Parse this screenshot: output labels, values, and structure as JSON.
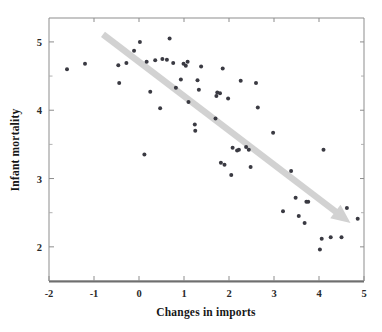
{
  "chart_data": {
    "type": "scatter",
    "title": "",
    "xlabel": "Changes in imports",
    "ylabel": "Infant mortality",
    "xlim": [
      -2,
      5
    ],
    "ylim": [
      1.5,
      5.35
    ],
    "xticks": [
      -2,
      -1,
      0,
      1,
      2,
      3,
      4,
      5
    ],
    "xtick_labels": [
      "-2",
      "-1",
      "0",
      "1",
      "2",
      "3",
      "4",
      "5"
    ],
    "yticks": [
      2,
      3,
      4,
      5
    ],
    "ytick_labels": [
      "2",
      "3",
      "4",
      "5"
    ],
    "yticks_minor": [
      2.5,
      3.5,
      4.5
    ],
    "grid": false,
    "legend": null,
    "marker_color": "#3a3a42",
    "trend_color": "#d2d2d2",
    "annotations": [
      {
        "type": "arrow",
        "label": "downward-trend-arrow",
        "from": [
          -0.8,
          5.11
        ],
        "to": [
          4.7,
          2.35
        ],
        "color": "#d2d2d2"
      }
    ],
    "points": [
      [
        -1.6,
        4.6
      ],
      [
        -1.2,
        4.68
      ],
      [
        -0.46,
        4.66
      ],
      [
        -0.44,
        4.4
      ],
      [
        -0.28,
        4.69
      ],
      [
        -0.11,
        4.87
      ],
      [
        0.02,
        5.0
      ],
      [
        0.12,
        3.35
      ],
      [
        0.17,
        4.71
      ],
      [
        0.25,
        4.27
      ],
      [
        0.36,
        4.73
      ],
      [
        0.47,
        4.03
      ],
      [
        0.52,
        4.75
      ],
      [
        0.62,
        4.74
      ],
      [
        0.68,
        5.05
      ],
      [
        0.76,
        4.69
      ],
      [
        0.82,
        4.33
      ],
      [
        0.93,
        4.45
      ],
      [
        0.99,
        4.68
      ],
      [
        1.04,
        4.65
      ],
      [
        1.08,
        4.71
      ],
      [
        1.1,
        4.12
      ],
      [
        1.24,
        3.79
      ],
      [
        1.25,
        3.7
      ],
      [
        1.3,
        4.44
      ],
      [
        1.33,
        4.3
      ],
      [
        1.38,
        4.64
      ],
      [
        1.7,
        3.88
      ],
      [
        1.72,
        4.21
      ],
      [
        1.74,
        4.26
      ],
      [
        1.8,
        4.25
      ],
      [
        1.82,
        3.23
      ],
      [
        1.86,
        4.61
      ],
      [
        1.9,
        3.2
      ],
      [
        1.98,
        4.17
      ],
      [
        2.05,
        3.05
      ],
      [
        2.08,
        3.45
      ],
      [
        2.18,
        3.41
      ],
      [
        2.22,
        3.42
      ],
      [
        2.26,
        4.43
      ],
      [
        2.38,
        3.46
      ],
      [
        2.44,
        3.42
      ],
      [
        2.48,
        3.17
      ],
      [
        2.6,
        4.4
      ],
      [
        2.64,
        4.04
      ],
      [
        2.98,
        3.67
      ],
      [
        3.2,
        2.52
      ],
      [
        3.38,
        3.11
      ],
      [
        3.48,
        2.72
      ],
      [
        3.55,
        2.45
      ],
      [
        3.68,
        2.35
      ],
      [
        3.72,
        2.66
      ],
      [
        3.76,
        2.66
      ],
      [
        4.02,
        1.96
      ],
      [
        4.06,
        2.12
      ],
      [
        4.1,
        3.42
      ],
      [
        4.26,
        2.14
      ],
      [
        4.5,
        2.14
      ],
      [
        4.62,
        2.57
      ],
      [
        4.86,
        2.41
      ]
    ]
  },
  "figure": {
    "name": "scatter-plot-infant-mortality-vs-changes-in-imports"
  }
}
